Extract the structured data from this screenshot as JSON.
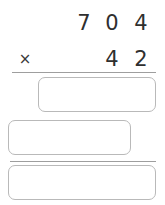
{
  "problem": {
    "type": "long-multiplication",
    "operator": "×",
    "multiplicand": {
      "value": "704",
      "digits": [
        "7",
        "0",
        "4"
      ]
    },
    "multiplier": {
      "value": "42",
      "digits": [
        "4",
        "2"
      ]
    }
  },
  "answer_fields": [
    {
      "name": "partial-product-1",
      "value": "",
      "placeholder": ""
    },
    {
      "name": "partial-product-2",
      "value": "",
      "placeholder": ""
    },
    {
      "name": "final-product",
      "value": "",
      "placeholder": ""
    }
  ],
  "colors": {
    "digit": "#2f2f2f",
    "rule": "#9e9e9e",
    "box_border": "#b9b9b9",
    "background": "#ffffff"
  }
}
